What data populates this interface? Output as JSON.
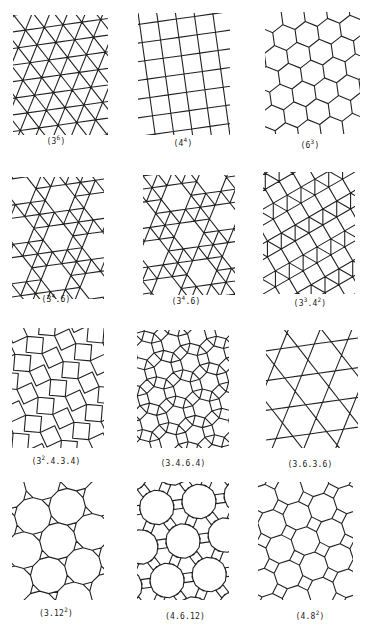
{
  "figure": {
    "stroke_color": "#222222",
    "background": "#ffffff",
    "panels": [
      {
        "id": "3^6",
        "label_base": "3",
        "label_sup": "6",
        "label_rest": "",
        "label_pre": "(",
        "label_post": ")",
        "type": "triangular",
        "box": [
          13,
          15,
          95,
          120
        ],
        "label_xy": [
          56,
          142
        ],
        "rot": -8
      },
      {
        "id": "4^4",
        "label_base": "4",
        "label_sup": "4",
        "label_rest": "",
        "label_pre": "(",
        "label_post": ")",
        "type": "square",
        "box": [
          138,
          13,
          92,
          122
        ],
        "label_xy": [
          183,
          144
        ],
        "rot": -8
      },
      {
        "id": "6^3",
        "label_base": "6",
        "label_sup": "3",
        "label_rest": "",
        "label_pre": "(",
        "label_post": ")",
        "type": "hexagonal",
        "box": [
          265,
          12,
          95,
          122
        ],
        "label_xy": [
          310,
          146
        ],
        "rot": -8
      },
      {
        "id": "3^4.6 a",
        "label_base": "3",
        "label_sup": "4",
        "label_rest": ".6",
        "label_pre": "(",
        "label_post": ")",
        "type": "snubhex",
        "box": [
          12,
          177,
          92,
          122
        ],
        "label_xy": [
          56,
          300
        ],
        "rot": -8
      },
      {
        "id": "3^4.6 b",
        "label_base": "3",
        "label_sup": "4",
        "label_rest": ".6",
        "label_pre": "(",
        "label_post": ")",
        "type": "snubhex",
        "box": [
          143,
          175,
          92,
          120
        ],
        "label_xy": [
          186,
          302
        ],
        "rot": -8,
        "mirror": true
      },
      {
        "id": "3^3.4^2",
        "label_base": "3",
        "label_sup": "3",
        "label_rest": ".4",
        "label_sup2": "2",
        "label_pre": "(",
        "label_post": ")",
        "type": "elongated",
        "box": [
          263,
          172,
          92,
          122
        ],
        "label_xy": [
          310,
          304
        ],
        "rot": -30
      },
      {
        "id": "3^2.4.3.4",
        "label_base": "3",
        "label_sup": "2",
        "label_rest": ".4.3.4",
        "label_pre": "(",
        "label_post": ")",
        "type": "snubsquare",
        "box": [
          12,
          328,
          92,
          120
        ],
        "label_xy": [
          56,
          462
        ],
        "rot": -10
      },
      {
        "id": "3.4.6.4",
        "label_base": "3.4.6.4",
        "label_sup": "",
        "label_rest": "",
        "label_pre": "(",
        "label_post": ")",
        "type": "rhombitrihex",
        "box": [
          137,
          330,
          92,
          118
        ],
        "label_xy": [
          183,
          464
        ],
        "rot": -15
      },
      {
        "id": "3.6.3.6",
        "label_base": "3.6.3.6",
        "label_sup": "",
        "label_rest": "",
        "label_pre": "(",
        "label_post": ")",
        "type": "trihexagonal",
        "box": [
          266,
          330,
          92,
          118
        ],
        "label_xy": [
          310,
          465
        ],
        "rot": -8
      },
      {
        "id": "3.12^2",
        "label_base": "3.12",
        "label_sup": "2",
        "label_rest": "",
        "label_pre": "(",
        "label_post": ")",
        "type": "trunchex",
        "box": [
          12,
          482,
          92,
          118
        ],
        "label_xy": [
          56,
          614
        ],
        "rot": -15
      },
      {
        "id": "4.6.12",
        "label_base": "4.6.12",
        "label_sup": "",
        "label_rest": "",
        "label_pre": "(",
        "label_post": ")",
        "type": "trunctrihex",
        "box": [
          137,
          482,
          92,
          118
        ],
        "label_xy": [
          185,
          617
        ],
        "rot": -8
      },
      {
        "id": "4.8^2",
        "label_base": "4.8",
        "label_sup": "2",
        "label_rest": "",
        "label_pre": "(",
        "label_post": ")",
        "type": "truncsquare",
        "box": [
          258,
          482,
          95,
          118
        ],
        "label_xy": [
          310,
          617
        ],
        "rot": -18
      }
    ]
  }
}
